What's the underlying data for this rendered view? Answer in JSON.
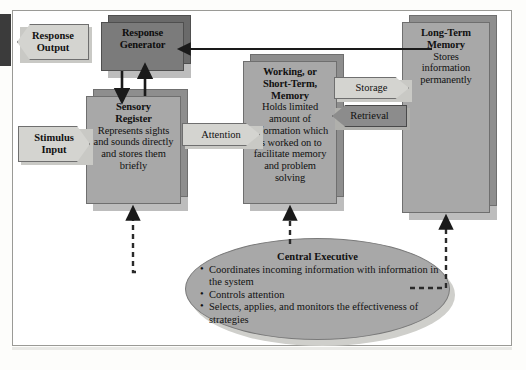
{
  "diagram": {
    "response_output": {
      "label": "Response\nOutput",
      "shape": "left-chevron",
      "color": "#d4d4d0"
    },
    "stimulus_input": {
      "label": "Stimulus\nInput",
      "shape": "right-chevron",
      "color": "#d4d4d0"
    },
    "attention": {
      "label": "Attention",
      "shape": "right-chevron",
      "color": "#d4d4d0"
    },
    "storage": {
      "label": "Storage",
      "shape": "right-chevron",
      "color": "#d4d4d0"
    },
    "retrieval": {
      "label": "Retrieval",
      "shape": "left-chevron",
      "color": "#8c8c8c"
    },
    "response_generator": {
      "title": "Response",
      "title2": "Generator",
      "color": "#7b7b7b"
    },
    "sensory_register": {
      "title": "Sensory",
      "title2": "Register",
      "body": "Represents sights and sounds directly and stores them briefly",
      "color": "#a8a8a8"
    },
    "working_memory": {
      "title": "Working, or",
      "title2": "Short-Term,",
      "title3": "Memory",
      "body": "Holds limited amount of information which is worked on to facilitate memory and problem solving",
      "color": "#a8a8a8"
    },
    "long_term_memory": {
      "title": "Long-Term",
      "title2": "Memory",
      "body": "Stores information permanently",
      "color": "#a8a8a8"
    },
    "central_executive": {
      "title": "Central Executive",
      "bullets": [
        "Coordinates incoming information with information in the system",
        "Controls attention",
        "Selects, applies, and monitors the effectiveness of strategies"
      ],
      "color": "#a8a8a8"
    }
  }
}
